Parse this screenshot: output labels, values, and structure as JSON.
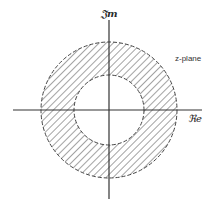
{
  "diagram": {
    "type": "annular region of convergence in complex plane",
    "labels": {
      "imaginary_axis": "𝔍m",
      "real_axis": "ℜe",
      "plane": "z-plane"
    },
    "geometry": {
      "center": [
        109,
        110
      ],
      "outer_radius": 68,
      "inner_radius": 35,
      "horizontal_axis": {
        "x1": 13,
        "x2": 202,
        "y": 110
      },
      "vertical_axis": {
        "x": 109,
        "y1": 20,
        "y2": 199
      }
    },
    "styles": {
      "line_color": "#333333",
      "hatch_color": "#555555",
      "background": "#ffffff",
      "boundary": "dashed",
      "fill": "diagonal-hatch"
    }
  }
}
